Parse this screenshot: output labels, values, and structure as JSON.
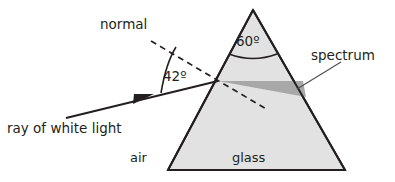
{
  "diagram": {
    "labels": {
      "normal": "normal",
      "incident_ray": "ray of white light",
      "spectrum": "spectrum",
      "air": "air",
      "glass": "glass",
      "apex_angle": "60º",
      "incidence_angle": "42º"
    },
    "colors": {
      "stroke": "#231f20",
      "glass_fill": "#e2e2e2",
      "spectrum_fill": "#a8a8a8",
      "background": "#ffffff",
      "leader_line": "#4d4d4d"
    },
    "geometry": {
      "prism": {
        "apex": [
          253,
          10
        ],
        "base_left": [
          168,
          170
        ],
        "base_right": [
          345,
          170
        ]
      },
      "entry_point": [
        218,
        81
      ],
      "incident_ray": {
        "start": [
          66,
          118
        ],
        "end": [
          218,
          81
        ],
        "arrow_at": [
          143,
          99
        ]
      },
      "normal_dashed": {
        "start": [
          151,
          41
        ],
        "end": [
          268,
          110
        ]
      },
      "spectrum_wedge": [
        [
          218,
          81
        ],
        [
          303,
          81
        ],
        [
          305,
          96
        ]
      ],
      "apex_arc_radius": 44,
      "incidence_arc_radius": 58,
      "spectrum_leader": {
        "start": [
          300,
          88
        ],
        "end": [
          340,
          62
        ]
      }
    }
  }
}
